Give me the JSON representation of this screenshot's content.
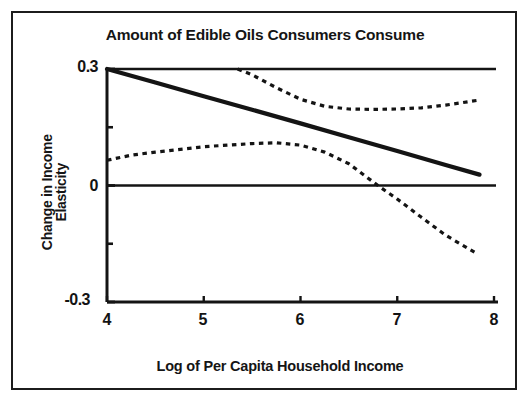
{
  "chart_data": {
    "type": "line",
    "title": "Amount of Edible Oils Consumers Consume",
    "xlabel": "Log of Per Capita Household Income",
    "ylabel": "Change in Income Elasticity",
    "ylabel_lines": [
      "Change in Income",
      "Elasticity"
    ],
    "xlim": [
      4,
      8
    ],
    "ylim": [
      -0.3,
      0.3
    ],
    "xticks": [
      4,
      5,
      6,
      7,
      8
    ],
    "xtick_labels": [
      "4",
      "5",
      "6",
      "7",
      "8"
    ],
    "yticks": [
      -0.3,
      0,
      0.3
    ],
    "ytick_labels": [
      "-0.3",
      "0",
      "0.3"
    ],
    "y_minor_ticks": [
      -0.15,
      0.15
    ],
    "grid": false,
    "legend": "none",
    "reference_lines": [
      {
        "name": "top-border",
        "y": 0.3,
        "style": "solid"
      },
      {
        "name": "zero-line",
        "y": 0,
        "style": "solid"
      },
      {
        "name": "bottom-axis",
        "y": -0.3,
        "style": "solid"
      }
    ],
    "series": [
      {
        "name": "Change in income elasticity (estimate)",
        "style": "solid",
        "x": [
          4.0,
          4.5,
          5.0,
          5.5,
          6.0,
          6.5,
          7.0,
          7.5,
          7.85
        ],
        "values": [
          0.3,
          0.265,
          0.23,
          0.195,
          0.16,
          0.124,
          0.089,
          0.053,
          0.028
        ]
      },
      {
        "name": "Upper confidence band",
        "style": "dashed",
        "x": [
          5.35,
          5.5,
          5.75,
          6.0,
          6.25,
          6.5,
          6.75,
          7.0,
          7.25,
          7.5,
          7.85
        ],
        "values": [
          0.3,
          0.285,
          0.252,
          0.222,
          0.204,
          0.197,
          0.196,
          0.197,
          0.2,
          0.207,
          0.22
        ]
      },
      {
        "name": "Lower confidence band",
        "style": "dashed",
        "x": [
          4.0,
          4.25,
          4.5,
          5.0,
          5.5,
          5.75,
          6.0,
          6.25,
          6.5,
          6.8,
          7.0,
          7.25,
          7.5,
          7.8
        ],
        "values": [
          0.065,
          0.078,
          0.086,
          0.1,
          0.108,
          0.11,
          0.104,
          0.086,
          0.056,
          0.0,
          -0.035,
          -0.082,
          -0.128,
          -0.172
        ]
      }
    ],
    "annotations": []
  },
  "colors": {
    "ink": "#151515",
    "paper": "#ffffff"
  }
}
